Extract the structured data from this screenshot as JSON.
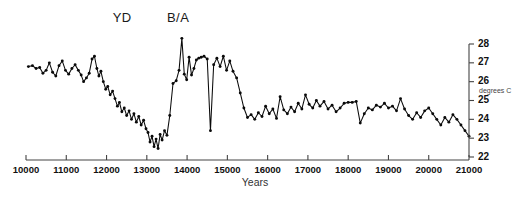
{
  "chart_data": {
    "type": "line",
    "title": "",
    "xlabel": "Years",
    "ylabel": "degrees C",
    "xlim": [
      10000,
      21000
    ],
    "ylim": [
      22,
      28
    ],
    "grid": false,
    "legend": null,
    "x_ticks": [
      10000,
      11000,
      12000,
      13000,
      14000,
      15000,
      16000,
      17000,
      18000,
      19000,
      20000,
      21000
    ],
    "x_tick_labels": [
      "10000",
      "11000",
      "12000",
      "13000",
      "14000",
      "15000",
      "16000",
      "17000",
      "18000",
      "19000",
      "20000",
      "21000"
    ],
    "y_ticks": [
      22,
      23,
      24,
      25,
      26,
      27,
      28
    ],
    "y_tick_labels": [
      "22",
      "23",
      "24",
      "25",
      "26",
      "27",
      "28"
    ],
    "y_axis_position": "right",
    "x_axis_direction": "increasing-left-to-right",
    "markers": true,
    "annotations": [
      {
        "label": "YD",
        "x": 12500,
        "y": 28.6
      },
      {
        "label": "B/A",
        "x": 13850,
        "y": 28.6
      }
    ],
    "series": [
      {
        "name": "temperature",
        "color": "#0a0a0a",
        "x": [
          10060,
          10160,
          10250,
          10340,
          10420,
          10500,
          10580,
          10660,
          10740,
          10820,
          10900,
          10980,
          11060,
          11140,
          11220,
          11300,
          11370,
          11430,
          11500,
          11570,
          11640,
          11700,
          11760,
          11810,
          11860,
          11920,
          11980,
          12030,
          12090,
          12150,
          12210,
          12270,
          12320,
          12380,
          12440,
          12500,
          12560,
          12620,
          12680,
          12740,
          12800,
          12860,
          12920,
          12980,
          13030,
          13080,
          13130,
          13180,
          13230,
          13280,
          13330,
          13380,
          13440,
          13500,
          13570,
          13650,
          13730,
          13800,
          13870,
          13930,
          13990,
          14050,
          14110,
          14170,
          14230,
          14290,
          14350,
          14420,
          14500,
          14580,
          14660,
          14740,
          14820,
          14900,
          14980,
          15060,
          15140,
          15230,
          15320,
          15410,
          15500,
          15590,
          15680,
          15770,
          15860,
          15950,
          16040,
          16130,
          16220,
          16310,
          16400,
          16490,
          16580,
          16670,
          16760,
          16850,
          16940,
          17030,
          17120,
          17210,
          17300,
          17400,
          17500,
          17600,
          17700,
          17800,
          17900,
          18000,
          18100,
          18200,
          18300,
          18400,
          18500,
          18600,
          18700,
          18800,
          18900,
          19000,
          19100,
          19200,
          19300,
          19400,
          19500,
          19600,
          19700,
          19800,
          19900,
          20000,
          20100,
          20200,
          20300,
          20400,
          20500,
          20600,
          20700,
          20800,
          20900,
          21000
        ],
        "y": [
          26.8,
          26.85,
          26.7,
          26.75,
          26.45,
          26.6,
          27.0,
          26.5,
          26.3,
          26.85,
          27.1,
          26.6,
          26.4,
          26.7,
          26.9,
          26.6,
          26.35,
          26.0,
          26.2,
          26.45,
          27.2,
          27.35,
          26.7,
          26.3,
          26.55,
          26.0,
          25.6,
          25.75,
          25.3,
          25.5,
          25.1,
          24.7,
          24.9,
          24.4,
          24.6,
          24.2,
          24.45,
          24.0,
          24.3,
          23.85,
          24.15,
          23.7,
          23.95,
          23.5,
          23.3,
          22.8,
          23.1,
          22.55,
          22.95,
          22.45,
          23.2,
          22.9,
          23.4,
          23.15,
          24.2,
          25.9,
          26.05,
          26.6,
          28.3,
          26.4,
          26.1,
          27.3,
          26.35,
          26.7,
          27.15,
          27.25,
          27.3,
          27.35,
          27.2,
          23.4,
          26.9,
          27.25,
          26.8,
          27.35,
          26.6,
          27.1,
          26.55,
          26.2,
          25.4,
          24.6,
          24.1,
          24.25,
          24.0,
          24.35,
          24.15,
          24.7,
          24.3,
          24.55,
          24.05,
          25.2,
          24.5,
          24.3,
          24.65,
          24.4,
          24.85,
          24.55,
          25.3,
          24.8,
          24.6,
          25.0,
          24.7,
          24.95,
          24.55,
          24.75,
          24.4,
          24.6,
          24.85,
          24.9,
          24.9,
          24.95,
          23.8,
          24.3,
          24.6,
          24.5,
          24.75,
          24.65,
          24.85,
          24.6,
          24.7,
          24.45,
          25.1,
          24.55,
          24.2,
          24.0,
          24.35,
          24.1,
          24.45,
          24.6,
          24.3,
          24.0,
          23.7,
          24.1,
          23.85,
          24.25,
          24.0,
          23.7,
          23.4,
          23.1
        ]
      }
    ]
  }
}
